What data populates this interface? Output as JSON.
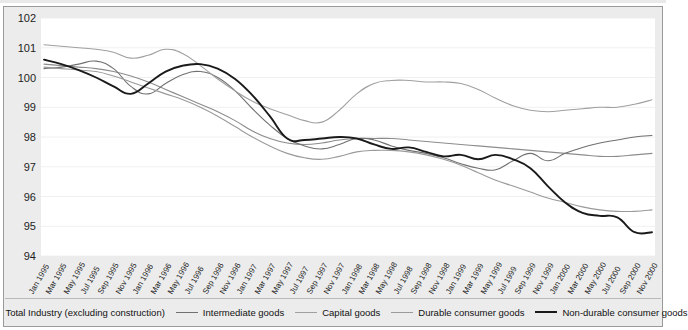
{
  "chart_data": {
    "type": "line",
    "title": "",
    "xlabel": "",
    "ylabel": "",
    "ylim": [
      94,
      102
    ],
    "yticks": [
      102,
      101,
      100,
      99,
      98,
      97,
      96,
      95,
      94
    ],
    "grid": true,
    "legend_position": "bottom",
    "x_tick_interval_months": 2,
    "categories": [
      "Jan 1995",
      "Mar 1995",
      "May 1995",
      "Jul 1995",
      "Sep 1995",
      "Nov 1995",
      "Jan 1996",
      "Mar 1996",
      "May 1996",
      "Jul 1996",
      "Sep 1996",
      "Nov 1996",
      "Jan 1997",
      "Mar 1997",
      "May 1997",
      "Jul 1997",
      "Sep 1997",
      "Nov 1997",
      "Jan 1998",
      "Mar 1998",
      "May 1998",
      "Jul 1998",
      "Sep 1998",
      "Nov 1998",
      "Jan 1999",
      "Mar 1999",
      "May 1999",
      "Jul 1999",
      "Sep 1999",
      "Nov 1999",
      "Jan 2000",
      "Mar 2000",
      "May 2000",
      "Jul 2000",
      "Sep 2000",
      "Nov 2000"
    ],
    "series": [
      {
        "name": "Total Industry (excluding construction)",
        "color": "#8c8c8c",
        "width": 1.1,
        "values": [
          100.45,
          100.4,
          100.35,
          100.3,
          100.2,
          100.05,
          99.85,
          99.6,
          99.35,
          99.1,
          98.85,
          98.55,
          98.2,
          97.95,
          97.8,
          97.75,
          97.8,
          97.9,
          97.95,
          97.95,
          97.95,
          97.9,
          97.85,
          97.8,
          97.75,
          97.7,
          97.65,
          97.6,
          97.55,
          97.5,
          97.45,
          97.4,
          97.35,
          97.35,
          97.4,
          97.45
        ]
      },
      {
        "name": "Intermediate goods",
        "color": "#707070",
        "width": 1.1,
        "values": [
          100.3,
          100.35,
          100.45,
          100.55,
          100.3,
          99.7,
          99.45,
          99.8,
          100.1,
          100.2,
          100.0,
          99.55,
          98.95,
          98.4,
          97.95,
          97.7,
          97.6,
          97.75,
          97.95,
          97.9,
          97.7,
          97.55,
          97.45,
          97.3,
          97.1,
          96.95,
          96.9,
          97.2,
          97.45,
          97.2,
          97.45,
          97.65,
          97.8,
          97.9,
          98.0,
          98.05
        ]
      },
      {
        "name": "Capital goods",
        "color": "#a0a0a0",
        "width": 1.1,
        "values": [
          101.1,
          101.05,
          101.0,
          100.95,
          100.85,
          100.65,
          100.75,
          100.95,
          100.8,
          100.4,
          99.95,
          99.55,
          99.2,
          98.95,
          98.75,
          98.55,
          98.5,
          98.9,
          99.45,
          99.8,
          99.9,
          99.9,
          99.85,
          99.85,
          99.8,
          99.6,
          99.3,
          99.05,
          98.9,
          98.85,
          98.9,
          98.95,
          99.0,
          99.0,
          99.1,
          99.25
        ]
      },
      {
        "name": "Durable consumer goods",
        "color": "#9a9a9a",
        "width": 1.1,
        "values": [
          100.35,
          100.3,
          100.25,
          100.2,
          100.05,
          99.85,
          99.65,
          99.45,
          99.25,
          99.0,
          98.7,
          98.35,
          98.0,
          97.7,
          97.45,
          97.3,
          97.25,
          97.35,
          97.5,
          97.55,
          97.55,
          97.5,
          97.4,
          97.25,
          97.05,
          96.8,
          96.55,
          96.35,
          96.15,
          95.95,
          95.8,
          95.65,
          95.55,
          95.5,
          95.5,
          95.55
        ]
      },
      {
        "name": "Non-durable consumer goods",
        "color": "#1a1a1a",
        "width": 1.9,
        "values": [
          100.6,
          100.45,
          100.25,
          100.0,
          99.7,
          99.45,
          99.8,
          100.2,
          100.4,
          100.45,
          100.3,
          99.95,
          99.4,
          98.7,
          97.95,
          97.9,
          97.95,
          98.0,
          97.95,
          97.75,
          97.6,
          97.65,
          97.5,
          97.35,
          97.4,
          97.25,
          97.4,
          97.25,
          96.95,
          96.35,
          95.8,
          95.45,
          95.35,
          95.3,
          94.8,
          94.8
        ]
      }
    ]
  },
  "legend": {
    "items": [
      {
        "label": "Total Industry (excluding construction)"
      },
      {
        "label": "Intermediate goods"
      },
      {
        "label": "Capital goods"
      },
      {
        "label": "Durable consumer goods"
      },
      {
        "label": "Non-durable consumer goods"
      }
    ]
  }
}
